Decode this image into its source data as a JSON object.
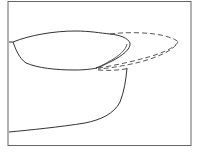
{
  "diagram": {
    "title": "",
    "colors": {
      "background": "#ffffff",
      "frame": "#555555",
      "line": "#333333",
      "dashed": "#444444"
    },
    "frame": {
      "x": 8,
      "y": 1,
      "width": 183,
      "height": 144
    },
    "shapes": [
      {
        "name": "solid-bulb-outline",
        "style": "solid"
      },
      {
        "name": "dashed-extended-bulb-outline",
        "style": "dashed"
      },
      {
        "name": "hull-stem-and-keel",
        "style": "solid"
      }
    ],
    "labels": []
  }
}
